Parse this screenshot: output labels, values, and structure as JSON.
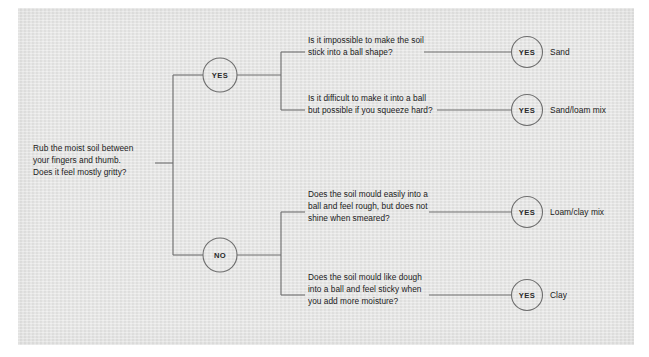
{
  "diagram": {
    "line_color": "#6e6e6e",
    "text_color": "#1b1b1b",
    "panel_color": "#e4e4e3"
  },
  "root": {
    "text": "Rub the moist soil between\nyour fingers and thumb.\nDoes it feel mostly gritty?"
  },
  "decisions": [
    {
      "label": "YES"
    },
    {
      "label": "NO"
    }
  ],
  "branches": [
    {
      "question": "Is it impossible to make the soil\nstick into a ball shape?",
      "answer": "YES",
      "outcome": "Sand"
    },
    {
      "question": "Is it difficult to make it into a ball\nbut possible if you squeeze hard?",
      "answer": "YES",
      "outcome": "Sand/loam mix"
    },
    {
      "question": "Does the soil mould easily into a\nball and feel rough, but does not\nshine when smeared?",
      "answer": "YES",
      "outcome": "Loam/clay mix"
    },
    {
      "question": "Does the soil mould like dough\ninto a ball and feel sticky when\nyou add more moisture?",
      "answer": "YES",
      "outcome": "Clay"
    }
  ]
}
